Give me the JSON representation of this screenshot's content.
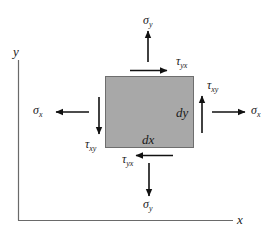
{
  "diagram": {
    "colors": {
      "element_fill": "#a8a8a8",
      "element_stroke": "#6e6e6e",
      "axis": "#6a6a6a",
      "arrow": "#111111",
      "text": "#1a1a1a"
    },
    "axes": {
      "x_label": "x",
      "y_label": "y"
    },
    "element": {
      "dx_label": "dx",
      "dy_label": "dy"
    },
    "stresses": {
      "sigma_y_top": {
        "symbol": "σ",
        "sub": "y",
        "direction": "up"
      },
      "sigma_y_bottom": {
        "symbol": "σ",
        "sub": "y",
        "direction": "down"
      },
      "sigma_x_right": {
        "symbol": "σ",
        "sub": "x",
        "direction": "right"
      },
      "sigma_x_left": {
        "symbol": "σ",
        "sub": "x",
        "direction": "left"
      },
      "tau_yx_top": {
        "symbol": "τ",
        "sub": "yx",
        "direction": "right"
      },
      "tau_yx_bottom": {
        "symbol": "τ",
        "sub": "yx",
        "direction": "left"
      },
      "tau_xy_right": {
        "symbol": "τ",
        "sub": "xy",
        "direction": "up"
      },
      "tau_xy_left": {
        "symbol": "τ",
        "sub": "xy",
        "direction": "down"
      }
    }
  }
}
